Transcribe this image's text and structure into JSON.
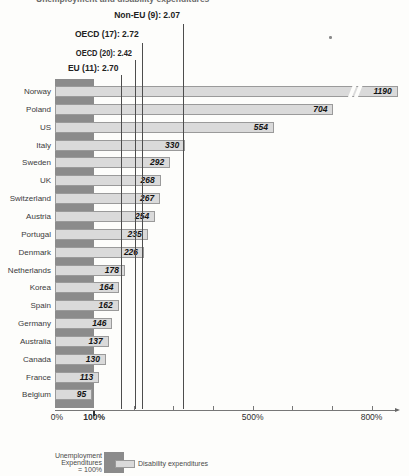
{
  "header": {
    "clipped_text_fragment": "Unemployment and disability expenditures"
  },
  "chart_data": {
    "type": "bar",
    "orientation": "horizontal",
    "title": "",
    "xlabel": "",
    "ylabel": "",
    "xlim_pct": [
      0,
      870
    ],
    "grid": false,
    "categories": [
      "Norway",
      "Poland",
      "US",
      "Italy",
      "Sweden",
      "UK",
      "Switzerland",
      "Austria",
      "Portugal",
      "Denmark",
      "Netherlands",
      "Korea",
      "Spain",
      "Germany",
      "Australia",
      "Canada",
      "France",
      "Belgium"
    ],
    "values": [
      1190,
      704,
      554,
      330,
      292,
      268,
      267,
      254,
      235,
      226,
      178,
      164,
      162,
      146,
      137,
      130,
      113,
      95
    ],
    "value_suffix": "%",
    "unemployment_reference_pct": 100,
    "clipped_bar": {
      "category": "Norway",
      "value": 1190,
      "drawn_to_pct": 866,
      "break_pct": 744
    },
    "reference_lines": [
      {
        "label": "Non-EU (9): 2.07",
        "axis_pct": 324,
        "label_y": 11,
        "line_top": 24,
        "condensed": false
      },
      {
        "label": "OECD (17): 2.72",
        "axis_pct": 220,
        "label_y": 30,
        "line_top": 43,
        "condensed": false
      },
      {
        "label": "OECD (20): 2.42",
        "axis_pct": 203,
        "label_y": 49,
        "line_top": 60,
        "condensed": true
      },
      {
        "label": "EU (11): 2.70",
        "axis_pct": 169,
        "label_y": 64,
        "line_top": 75,
        "condensed": false
      }
    ],
    "x_axis": {
      "labeled_ticks": [
        {
          "pct": 0,
          "label": "0%",
          "bold": false
        },
        {
          "pct": 100,
          "label": "100%",
          "bold": true
        },
        {
          "pct": 500,
          "label": "500%",
          "bold": false
        },
        {
          "pct": 800,
          "label": "800%",
          "bold": false
        }
      ],
      "minor_tick_pcts": [
        200,
        300,
        400,
        500,
        600,
        700,
        800
      ]
    },
    "legend": {
      "dark_label_lines": [
        "Unemployment",
        "Expenditures",
        "= 100%"
      ],
      "light_label": "Disability expenditures"
    },
    "colors": {
      "dark_bar": "#8b8b8b",
      "light_bar": "#dadada",
      "light_bar_border": "#9a9a9a",
      "reference_line": "#4d4d4d",
      "axis": "#777777",
      "label_text": "#3b3b3b",
      "value_text": "#141414",
      "background": "#fdfdfb"
    }
  }
}
